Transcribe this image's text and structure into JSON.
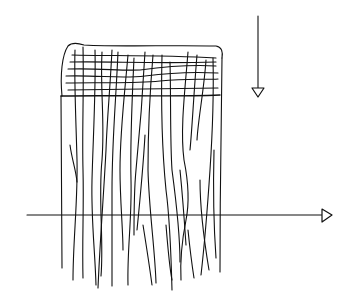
{
  "diagram": {
    "colors": {
      "ink": "#111111",
      "background": "#ffffff"
    },
    "elements": [
      {
        "id": "woven-band",
        "kind": "grid",
        "note": "interlaced horizontal and vertical strands at top"
      },
      {
        "id": "hanging-strands",
        "kind": "lines",
        "note": "wavy vertical fibres hanging below the band"
      },
      {
        "id": "vertical-arrow",
        "kind": "arrow",
        "direction": "down"
      },
      {
        "id": "horizontal-arrow",
        "kind": "arrow",
        "direction": "right"
      }
    ]
  }
}
